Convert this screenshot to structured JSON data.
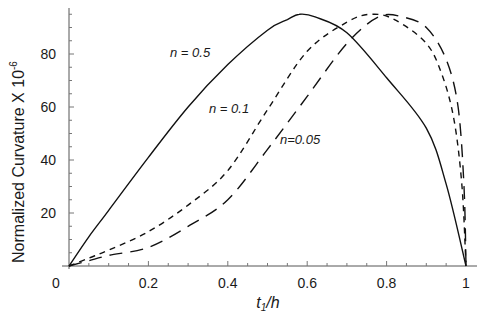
{
  "chart_data": {
    "type": "line",
    "title": "",
    "xlabel": "t1/h",
    "xlabel_main": "t",
    "xlabel_sub": "1",
    "xlabel_rest": "/h",
    "ylabel": "Normalized Curvature X 10",
    "ylabel_exp": "-6",
    "xlim": [
      0,
      1
    ],
    "ylim": [
      0,
      97
    ],
    "grid": false,
    "legend": "inline annotations",
    "x_ticks": [
      {
        "value": 0,
        "label": "0"
      },
      {
        "value": 0.2,
        "label": "0.2"
      },
      {
        "value": 0.4,
        "label": "0.4"
      },
      {
        "value": 0.6,
        "label": "0.6"
      },
      {
        "value": 0.8,
        "label": "0.8"
      },
      {
        "value": 1,
        "label": "1"
      }
    ],
    "y_ticks": [
      {
        "value": 20,
        "label": "20"
      },
      {
        "value": 40,
        "label": "40"
      },
      {
        "value": 60,
        "label": "60"
      },
      {
        "value": 80,
        "label": "80"
      }
    ],
    "origin_label": "0",
    "series": [
      {
        "name": "n = 0.5",
        "style": "solid",
        "label_pos": {
          "x": 170,
          "y": 57
        },
        "x": [
          0,
          0.05,
          0.1,
          0.2,
          0.3,
          0.4,
          0.5,
          0.55,
          0.58,
          0.62,
          0.7,
          0.8,
          0.9,
          0.95,
          1.0
        ],
        "y": [
          0,
          11,
          21,
          41,
          60,
          76,
          89,
          93,
          95,
          94,
          88,
          71,
          52,
          31,
          0
        ]
      },
      {
        "name": "n = 0.1",
        "style": "short-dash",
        "label_pos": {
          "x": 209,
          "y": 113
        },
        "x": [
          0,
          0.05,
          0.1,
          0.2,
          0.3,
          0.4,
          0.5,
          0.6,
          0.7,
          0.76,
          0.82,
          0.9,
          0.94,
          0.97,
          0.99,
          1.0
        ],
        "y": [
          0,
          3,
          6,
          13,
          23,
          36,
          59,
          81,
          92,
          95,
          93,
          84,
          72,
          55,
          30,
          0
        ]
      },
      {
        "name": "n=0.05",
        "style": "long-dash",
        "label_pos": {
          "x": 280,
          "y": 144
        },
        "x": [
          0,
          0.05,
          0.1,
          0.2,
          0.3,
          0.4,
          0.5,
          0.6,
          0.7,
          0.78,
          0.84,
          0.9,
          0.95,
          0.98,
          0.995,
          1.0
        ],
        "y": [
          0,
          2,
          4,
          7,
          15,
          25,
          44,
          64,
          84,
          94,
          94,
          90,
          78,
          60,
          30,
          0
        ]
      }
    ]
  }
}
